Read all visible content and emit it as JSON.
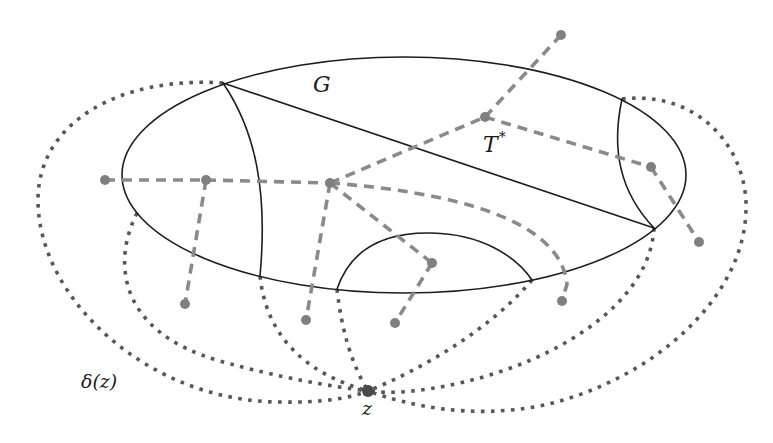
{
  "labels": {
    "G": "G",
    "T_star": {
      "base": "T",
      "sup": "*"
    },
    "delta_z": "δ(z)",
    "z": "z"
  },
  "colors": {
    "primal": "#1e1e1e",
    "dual": "#8a8a8a",
    "cut": "#575757",
    "node": "#808080",
    "z_node": "#4a4a4a",
    "background": "#ffffff"
  },
  "diagram": {
    "outer_face": {
      "cx": 404,
      "cy": 175,
      "rx": 282,
      "ry": 118
    },
    "solid_edges": [
      {
        "name": "diagonal-edge",
        "d": "M223,83 L654,228"
      },
      {
        "name": "left-inner-edge",
        "d": "M223,83 C255,130 268,190 260,276"
      },
      {
        "name": "right-inner-edge",
        "d": "M622,99 C611,150 620,192 654,228"
      },
      {
        "name": "bottom-arc-edge",
        "d": "M337,289 C352,245 390,232 432,233 C480,234 515,255 532,280"
      }
    ],
    "dual_nodes": [
      {
        "id": "n1",
        "x": 105,
        "y": 180
      },
      {
        "id": "n2",
        "x": 206,
        "y": 180
      },
      {
        "id": "n3",
        "x": 330,
        "y": 183
      },
      {
        "id": "n4",
        "x": 485,
        "y": 117
      },
      {
        "id": "n5",
        "x": 561,
        "y": 35
      },
      {
        "id": "n6",
        "x": 651,
        "y": 167
      },
      {
        "id": "n7",
        "x": 699,
        "y": 242
      },
      {
        "id": "n8",
        "x": 432,
        "y": 263
      },
      {
        "id": "n9",
        "x": 395,
        "y": 323
      },
      {
        "id": "n10",
        "x": 562,
        "y": 301
      },
      {
        "id": "n11",
        "x": 306,
        "y": 320
      },
      {
        "id": "n12",
        "x": 185,
        "y": 304
      }
    ],
    "dashed_edges": [
      {
        "name": "dual-edge-n1-n2",
        "d": "M105,180 L206,180"
      },
      {
        "name": "dual-edge-n2-n3",
        "d": "M206,180 L330,183"
      },
      {
        "name": "dual-edge-n2-n12",
        "d": "M206,180 L185,304"
      },
      {
        "name": "dual-edge-n3-n11",
        "d": "M330,183 L306,320"
      },
      {
        "name": "dual-edge-n3-n8",
        "d": "M330,183 L432,263"
      },
      {
        "name": "dual-edge-n8-n9",
        "d": "M432,263 L395,323"
      },
      {
        "name": "dual-edge-n3-n4",
        "d": "M330,183 L485,117"
      },
      {
        "name": "dual-edge-n4-n5",
        "d": "M485,117 L561,35"
      },
      {
        "name": "dual-edge-n4-n6",
        "d": "M485,117 L651,167"
      },
      {
        "name": "dual-edge-n6-n7",
        "d": "M651,167 L699,242"
      },
      {
        "name": "dual-edge-n3-n10",
        "d": "M330,183 C450,192 560,218 567,284 L562,301"
      }
    ],
    "z_node": {
      "x": 368,
      "y": 391,
      "r": 6
    },
    "dotted_edges": [
      {
        "name": "cut-edge-outer-left",
        "d": "M223,83 C120,76 38,122 38,200 C38,300 150,402 280,402 C322,403 350,398 368,391"
      },
      {
        "name": "cut-edge-inner-left",
        "d": "M137,213 C112,262 118,332 220,361 C280,378 330,386 368,391"
      },
      {
        "name": "cut-edge-left-vertex",
        "d": "M260,276 C266,332 300,372 368,391"
      },
      {
        "name": "cut-edge-arc-left",
        "d": "M337,289 Q344,352 368,391"
      },
      {
        "name": "cut-edge-arc-right",
        "d": "M532,280 C490,330 420,370 368,391"
      },
      {
        "name": "cut-edge-right-vertex",
        "d": "M654,228 C650,302 560,360 460,383 C420,392 390,394 368,391"
      },
      {
        "name": "cut-edge-outer-right",
        "d": "M622,99 C700,90 748,150 746,210 C744,300 650,382 540,406 C470,419 410,406 368,391"
      }
    ],
    "label_positions": {
      "G": {
        "x": 313,
        "y": 92
      },
      "T_star": {
        "x": 483,
        "y": 152
      },
      "delta_z": {
        "x": 81,
        "y": 388
      },
      "z": {
        "x": 362,
        "y": 415
      }
    }
  }
}
